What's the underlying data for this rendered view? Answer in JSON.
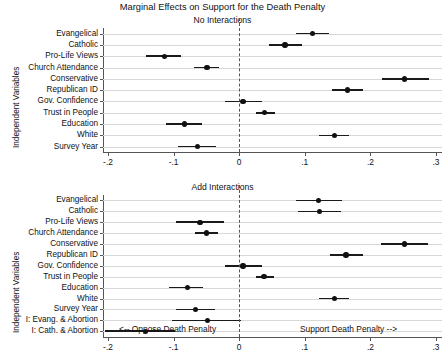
{
  "figure": {
    "title": "Marginal Effects on Support for the Death Penalty",
    "y_axis_title": "Independent Variables",
    "footnote_left": "<-- Oppose Death Penalty",
    "footnote_right": "Support Death Penalty -->",
    "point_color": "#111111",
    "grid_color": "#d8d8d8",
    "zeroline_color": "#555555"
  },
  "chart_data": [
    {
      "type": "scatter",
      "title": "Marginal Effects on Support for the Death Penalty",
      "subtitle": "No Interactions",
      "panel": "top",
      "xlabel": "",
      "ylabel": "Independent Variables",
      "xlim": [
        -0.2,
        0.3
      ],
      "xticks": [
        -0.2,
        -0.1,
        0.0,
        0.1,
        0.2,
        0.3
      ],
      "xtick_labels": [
        "-.2",
        "-.1",
        "0",
        ".1",
        ".2",
        ".3"
      ],
      "grid": true,
      "reference_line": 0,
      "legend": "none",
      "categories": [
        "Evangelical",
        "Catholic",
        "Pro-Life Views",
        "Church Attendance",
        "Conservative",
        "Republican ID",
        "Gov. Confidence",
        "Trust in People",
        "Education",
        "White",
        "Survey Year"
      ],
      "values": [
        0.112,
        0.07,
        -0.114,
        -0.049,
        0.252,
        0.165,
        0.006,
        0.039,
        -0.083,
        0.145,
        -0.064
      ],
      "ci_low": [
        0.086,
        0.045,
        -0.142,
        -0.069,
        0.217,
        0.141,
        -0.022,
        0.026,
        -0.111,
        0.122,
        -0.094
      ],
      "ci_high": [
        0.137,
        0.096,
        -0.089,
        -0.031,
        0.289,
        0.189,
        0.035,
        0.054,
        -0.057,
        0.167,
        -0.036
      ]
    },
    {
      "type": "scatter",
      "subtitle": "Add Interactions",
      "panel": "bottom",
      "xlabel": "",
      "ylabel": "Independent Variables",
      "xlim": [
        -0.2,
        0.3
      ],
      "xticks": [
        -0.2,
        -0.1,
        0.0,
        0.1,
        0.2,
        0.3
      ],
      "xtick_labels": [
        "-.2",
        "-.1",
        "0",
        ".1",
        ".2",
        ".3"
      ],
      "grid": true,
      "reference_line": 0,
      "legend": "none",
      "categories": [
        "Evangelical",
        "Catholic",
        "Pro-Life Views",
        "Church Attendance",
        "Conservative",
        "Republican ID",
        "Gov. Confidence",
        "Trust in People",
        "Education",
        "White",
        "Survey Year",
        "I: Evang. & Abortion",
        "I: Cath. & Abortion"
      ],
      "values": [
        0.121,
        0.122,
        -0.06,
        -0.05,
        0.252,
        0.163,
        0.006,
        0.038,
        -0.079,
        0.145,
        -0.067,
        -0.048,
        -0.143
      ],
      "ci_low": [
        0.087,
        0.089,
        -0.096,
        -0.068,
        0.216,
        0.139,
        -0.022,
        0.025,
        -0.107,
        0.122,
        -0.097,
        -0.103,
        -0.205
      ],
      "ci_high": [
        0.157,
        0.155,
        -0.023,
        -0.032,
        0.288,
        0.188,
        0.035,
        0.053,
        -0.055,
        0.168,
        -0.037,
        0.002,
        -0.098
      ]
    }
  ]
}
